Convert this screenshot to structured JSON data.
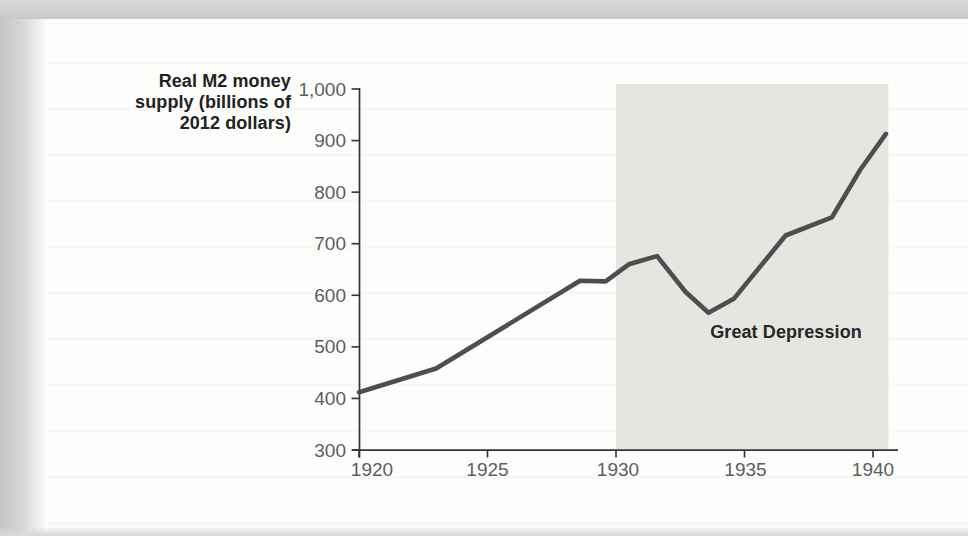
{
  "figure": {
    "description_visible_text_only": "line chart of real M2 money supply 1920-1940 with Great Depression shading"
  },
  "chart_data": {
    "type": "line",
    "title": "",
    "xlabel": "",
    "ylabel": "Real M2 money supply (billions of 2012 dollars)",
    "ylabel_lines": [
      "Real M2 money",
      "supply (billions of",
      "2012 dollars)"
    ],
    "xlim": [
      1920,
      1941
    ],
    "ylim": [
      300,
      1000
    ],
    "grid": false,
    "legend": false,
    "x_ticks": [
      1920,
      1925,
      1930,
      1935,
      1940
    ],
    "x_tick_labels": [
      "1920",
      "1925",
      "1930",
      "1935",
      "1940"
    ],
    "y_ticks": [
      300,
      400,
      500,
      600,
      700,
      800,
      900,
      1000
    ],
    "y_tick_labels": [
      "300",
      "400",
      "500",
      "600",
      "700",
      "800",
      "900",
      "1,000"
    ],
    "series": [
      {
        "name": "Real M2 money supply (billions of 2012 dollars)",
        "color": "#4e4e4e",
        "points": [
          [
            1920.0,
            412
          ],
          [
            1923.0,
            458
          ],
          [
            1928.6,
            628
          ],
          [
            1929.6,
            627
          ],
          [
            1930.5,
            660
          ],
          [
            1931.6,
            676
          ],
          [
            1932.7,
            607
          ],
          [
            1933.6,
            566
          ],
          [
            1934.6,
            594
          ],
          [
            1936.6,
            716
          ],
          [
            1938.4,
            751
          ],
          [
            1939.5,
            843
          ],
          [
            1940.5,
            913
          ]
        ]
      }
    ],
    "annotations": [
      {
        "type": "shaded_region",
        "label": "Great Depression",
        "x_start": 1930,
        "x_end": 1940.6,
        "color": "#e5e5e2"
      }
    ],
    "axis_color": "#333332",
    "tick_label_color": "#5c5d5f"
  }
}
